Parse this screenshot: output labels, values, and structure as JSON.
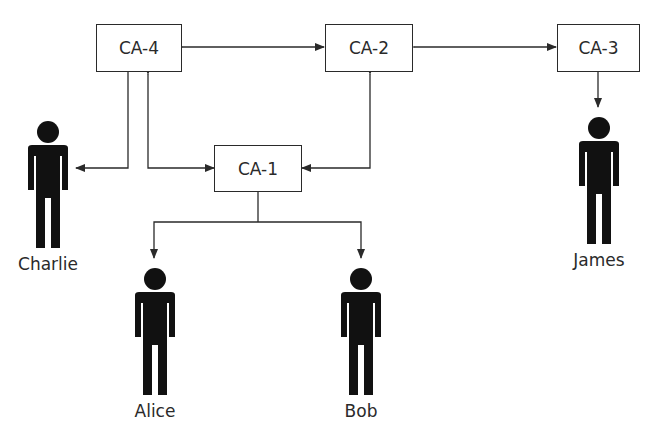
{
  "diagram": {
    "type": "certificate-authority-trust-graph",
    "nodes": {
      "ca4": {
        "label": "CA-4"
      },
      "ca2": {
        "label": "CA-2"
      },
      "ca3": {
        "label": "CA-3"
      },
      "ca1": {
        "label": "CA-1"
      }
    },
    "people": {
      "charlie": {
        "label": "Charlie",
        "icon": "person-icon"
      },
      "alice": {
        "label": "Alice",
        "icon": "person-icon"
      },
      "bob": {
        "label": "Bob",
        "icon": "person-icon"
      },
      "james": {
        "label": "James",
        "icon": "person-icon"
      }
    },
    "edges": [
      {
        "from": "CA-4",
        "to": "CA-2",
        "type": "bidirectional"
      },
      {
        "from": "CA-2",
        "to": "CA-3",
        "type": "bidirectional"
      },
      {
        "from": "CA-4",
        "to": "CA-1",
        "type": "bidirectional"
      },
      {
        "from": "CA-2",
        "to": "CA-1",
        "type": "bidirectional"
      },
      {
        "from": "CA-4",
        "to": "Charlie",
        "type": "directed"
      },
      {
        "from": "CA-3",
        "to": "James",
        "type": "directed"
      },
      {
        "from": "CA-1",
        "to": "Alice",
        "type": "directed"
      },
      {
        "from": "CA-1",
        "to": "Bob",
        "type": "directed"
      }
    ],
    "colors": {
      "line": "#2a2a2a",
      "figure": "#111111",
      "background": "#ffffff"
    }
  }
}
